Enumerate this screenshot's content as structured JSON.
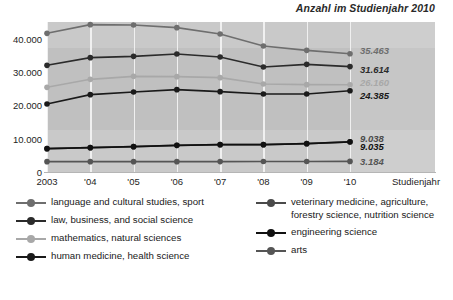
{
  "chart_data": {
    "type": "line",
    "title": "Anzahl im Studienjahr 2010",
    "xlabel": "Studienjahr",
    "ylabel": "",
    "ylim": [
      0,
      45000
    ],
    "grid": "vertical",
    "legend_position": "bottom",
    "categories": [
      "2003",
      "'04",
      "'05",
      "'06",
      "'07",
      "'08",
      "'09",
      "'10"
    ],
    "ytick_labels": [
      "0",
      "10.000",
      "20.000",
      "30.000",
      "40.000"
    ],
    "ytick_values": [
      0,
      10000,
      20000,
      30000,
      40000
    ],
    "series": [
      {
        "name": "language and cultural studies, sport",
        "color": "#6e6e6e",
        "end_label": "35.463",
        "end_value": 35463,
        "values": [
          41600,
          44200,
          44100,
          43300,
          41400,
          37800,
          36500,
          35463
        ]
      },
      {
        "name": "law, business, and social science",
        "color": "#2b2b2b",
        "end_label": "31.614",
        "end_value": 31614,
        "values": [
          32000,
          34300,
          34700,
          35400,
          34500,
          31500,
          32300,
          31614
        ]
      },
      {
        "name": "mathematics, natural sciences",
        "color": "#a8a8a8",
        "end_label": "26.160",
        "end_value": 26160,
        "values": [
          25400,
          27800,
          28700,
          28600,
          28300,
          26400,
          26200,
          26160
        ]
      },
      {
        "name": "human medicine, health science",
        "color": "#1a1a1a",
        "end_label": "24.385",
        "end_value": 24385,
        "values": [
          20400,
          23200,
          24000,
          24700,
          24100,
          23400,
          23400,
          24385
        ]
      },
      {
        "name": "veterinary medicine, agriculture, forestry science, nutrition science",
        "color": "#4a4a4a",
        "end_label": "9.038",
        "end_value": 9038,
        "values": [
          7000,
          7300,
          7600,
          8000,
          8200,
          8200,
          8500,
          9038
        ]
      },
      {
        "name": "engineering science",
        "color": "#111111",
        "end_label": "9.035",
        "end_value": 9035,
        "values": [
          7000,
          7300,
          7600,
          8000,
          8200,
          8200,
          8500,
          9035
        ]
      },
      {
        "name": "arts",
        "color": "#555555",
        "end_label": "3.184",
        "end_value": 3184,
        "values": [
          3100,
          3100,
          3100,
          3100,
          3120,
          3130,
          3150,
          3184
        ]
      }
    ]
  },
  "legend": {
    "left_items": [
      {
        "label": "language and cultural studies, sport",
        "color": "#6e6e6e"
      },
      {
        "label": "law, business, and social science",
        "color": "#2b2b2b"
      },
      {
        "label": "mathematics, natural sciences",
        "color": "#a8a8a8"
      },
      {
        "label": "human medicine, health science",
        "color": "#1a1a1a"
      }
    ],
    "right_items": [
      {
        "label": "veterinary medicine, agriculture, forestry science, nutrition science",
        "color": "#4a4a4a"
      },
      {
        "label": "engineering science",
        "color": "#111111"
      },
      {
        "label": "arts",
        "color": "#555555"
      }
    ]
  },
  "colors": {
    "band": "#c9c9c9",
    "band_mid": "#c0c0c0",
    "gridline": "#f0f0f0",
    "text": "#1d1d1d"
  }
}
